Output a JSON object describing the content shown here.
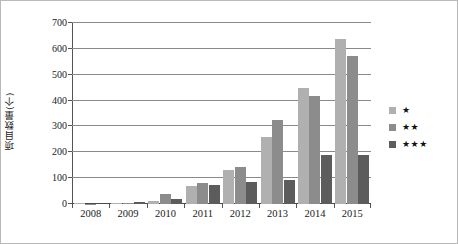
{
  "chart_data": {
    "type": "bar",
    "title": "",
    "xlabel": "",
    "ylabel": "项目数量(个)",
    "ylim": [
      0,
      700
    ],
    "yticks": [
      0,
      100,
      200,
      300,
      400,
      500,
      600,
      700
    ],
    "grid": true,
    "legend_position": "right",
    "categories": [
      "2008",
      "2009",
      "2010",
      "2011",
      "2012",
      "2013",
      "2014",
      "2015"
    ],
    "series": [
      {
        "name": "★",
        "color": "#b0b0b0",
        "values": [
          3,
          4,
          10,
          70,
          133,
          258,
          447,
          638
        ]
      },
      {
        "name": "★★",
        "color": "#8c8c8c",
        "values": [
          1,
          5,
          38,
          81,
          145,
          324,
          417,
          572
        ]
      },
      {
        "name": "★★★",
        "color": "#5c5c5c",
        "values": [
          0,
          7,
          19,
          73,
          87,
          92,
          190,
          189
        ]
      }
    ]
  },
  "legend": {
    "items": [
      {
        "label": "★"
      },
      {
        "label": "★★"
      },
      {
        "label": "★★★"
      }
    ]
  },
  "axis": {
    "y_title": "项目数量(个)",
    "y_tick_labels": [
      "700",
      "600",
      "500",
      "400",
      "300",
      "200",
      "100",
      "0"
    ],
    "x_tick_labels": [
      "2008",
      "2009",
      "2010",
      "2011",
      "2012",
      "2013",
      "2014",
      "2015"
    ]
  }
}
